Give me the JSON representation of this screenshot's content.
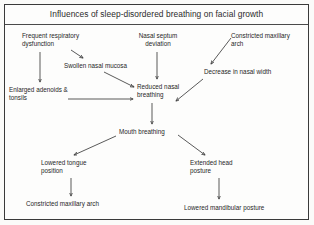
{
  "figure": {
    "title": "Influences of sleep-disordered breathing on facial growth",
    "background_color": "#fdfdfc",
    "border_color": "#3a3a3a",
    "text_color": "#262626",
    "arrow_color": "#3c3c3c",
    "width": 314,
    "height": 225
  },
  "nodes": [
    {
      "id": "frequent-respiratory-dysfunction",
      "label": "Frequent respiratory\ndysfunction",
      "x": 22,
      "y": 32,
      "align": "left"
    },
    {
      "id": "nasal-septum-deviation",
      "label": "Nasal septum\ndeviation",
      "x": 130,
      "y": 32,
      "align": "center",
      "width": 56
    },
    {
      "id": "constricted-maxillary-arch-top",
      "label": "Constricted maxillary\narch",
      "x": 231,
      "y": 32,
      "align": "left"
    },
    {
      "id": "swollen-nasal-mucosa",
      "label": "Swollen nasal mucosa",
      "x": 64,
      "y": 62,
      "align": "left"
    },
    {
      "id": "decrease-in-nasal-width",
      "label": "Decrease in nasal width",
      "x": 204,
      "y": 68,
      "align": "left"
    },
    {
      "id": "enlarged-adenoids-tonsils",
      "label": "Enlarged adenoids &\ntonsils",
      "x": 9,
      "y": 86,
      "align": "left"
    },
    {
      "id": "reduced-nasal-breathing",
      "label": "Reduced nasal\nbreathing",
      "x": 137,
      "y": 83,
      "align": "left"
    },
    {
      "id": "mouth-breathing",
      "label": "Mouth breathing",
      "x": 119,
      "y": 128,
      "align": "left"
    },
    {
      "id": "lowered-tongue-position",
      "label": "Lowered tongue\nposition",
      "x": 41,
      "y": 159,
      "align": "left"
    },
    {
      "id": "extended-head-posture",
      "label": "Extended head\nposture",
      "x": 190,
      "y": 159,
      "align": "left"
    },
    {
      "id": "constricted-maxillary-arch-bottom",
      "label": "Constricted maxillary arch",
      "x": 26,
      "y": 200,
      "align": "left"
    },
    {
      "id": "lowered-mandibular-posture",
      "label": "Lowered mandibular posture",
      "x": 184,
      "y": 204,
      "align": "left"
    }
  ],
  "edges": [
    {
      "id": "edge-frequent-to-swollen",
      "from": "frequent-respiratory-dysfunction",
      "to": "swollen-nasal-mucosa"
    },
    {
      "id": "edge-frequent-to-enlarged",
      "from": "frequent-respiratory-dysfunction",
      "to": "enlarged-adenoids-tonsils"
    },
    {
      "id": "edge-swollen-to-reduced",
      "from": "swollen-nasal-mucosa",
      "to": "reduced-nasal-breathing"
    },
    {
      "id": "edge-septum-to-reduced",
      "from": "nasal-septum-deviation",
      "to": "reduced-nasal-breathing"
    },
    {
      "id": "edge-constricted-to-decrease",
      "from": "constricted-maxillary-arch-top",
      "to": "decrease-in-nasal-width"
    },
    {
      "id": "edge-decrease-to-reduced",
      "from": "decrease-in-nasal-width",
      "to": "reduced-nasal-breathing"
    },
    {
      "id": "edge-enlarged-to-reduced",
      "from": "enlarged-adenoids-tonsils",
      "to": "reduced-nasal-breathing"
    },
    {
      "id": "edge-reduced-to-mouth",
      "from": "reduced-nasal-breathing",
      "to": "mouth-breathing"
    },
    {
      "id": "edge-mouth-to-tongue",
      "from": "mouth-breathing",
      "to": "lowered-tongue-position"
    },
    {
      "id": "edge-mouth-to-head",
      "from": "mouth-breathing",
      "to": "extended-head-posture"
    },
    {
      "id": "edge-tongue-to-arch",
      "from": "lowered-tongue-position",
      "to": "constricted-maxillary-arch-bottom"
    },
    {
      "id": "edge-head-to-mandibular",
      "from": "extended-head-posture",
      "to": "lowered-mandibular-posture"
    }
  ]
}
